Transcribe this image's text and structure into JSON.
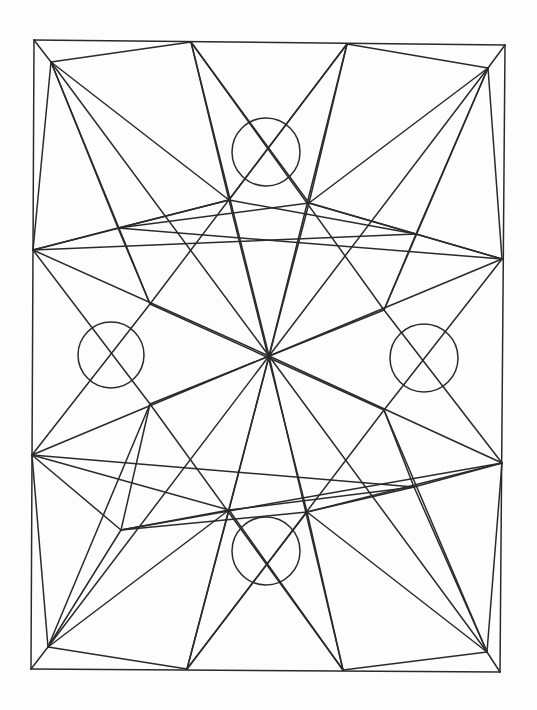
{
  "drawing": {
    "subject": "hand-drawn geometric star mandala line drawing",
    "stroke_color": "#2a2a2a",
    "background": "#fdfdfd",
    "points": {
      "TL": [
        34,
        40
      ],
      "TR": [
        505,
        45
      ],
      "BR": [
        500,
        672
      ],
      "BL": [
        31,
        669
      ],
      "A": [
        51,
        62
      ],
      "B": [
        488,
        68
      ],
      "C": [
        487,
        652
      ],
      "D": [
        48,
        647
      ],
      "T1": [
        191,
        42
      ],
      "T2": [
        347,
        44
      ],
      "B1": [
        187,
        669
      ],
      "B2": [
        343,
        670
      ],
      "L1": [
        33,
        250
      ],
      "L2": [
        32,
        455
      ],
      "R1": [
        502,
        259
      ],
      "R2": [
        502,
        463
      ],
      "O": [
        269,
        356
      ],
      "P1": [
        229,
        200
      ],
      "P2": [
        309,
        203
      ],
      "P3": [
        229,
        510
      ],
      "P4": [
        307,
        512
      ],
      "S1": [
        118,
        228
      ],
      "S2": [
        416,
        234
      ],
      "S3": [
        121,
        530
      ],
      "S4": [
        414,
        487
      ],
      "M1": [
        150,
        304
      ],
      "M2": [
        384,
        310
      ],
      "M3": [
        150,
        404
      ],
      "M4": [
        384,
        410
      ]
    },
    "segments": [
      [
        "TL",
        "TR"
      ],
      [
        "TR",
        "BR"
      ],
      [
        "BR",
        "BL"
      ],
      [
        "BL",
        "TL"
      ],
      [
        "TL",
        "A"
      ],
      [
        "TR",
        "B"
      ],
      [
        "BR",
        "C"
      ],
      [
        "BL",
        "D"
      ],
      [
        "A",
        "T1"
      ],
      [
        "T2",
        "B"
      ],
      [
        "B",
        "R1"
      ],
      [
        "R2",
        "C"
      ],
      [
        "C",
        "B2"
      ],
      [
        "B1",
        "D"
      ],
      [
        "D",
        "L2"
      ],
      [
        "L1",
        "A"
      ],
      [
        "A",
        "P1"
      ],
      [
        "A",
        "S1"
      ],
      [
        "A",
        "M1"
      ],
      [
        "A",
        "O"
      ],
      [
        "B",
        "P2"
      ],
      [
        "B",
        "S2"
      ],
      [
        "B",
        "M2"
      ],
      [
        "B",
        "O"
      ],
      [
        "C",
        "P4"
      ],
      [
        "C",
        "S4"
      ],
      [
        "C",
        "M4"
      ],
      [
        "C",
        "O"
      ],
      [
        "D",
        "P3"
      ],
      [
        "D",
        "S3"
      ],
      [
        "D",
        "M3"
      ],
      [
        "D",
        "O"
      ],
      [
        "T1",
        "P1"
      ],
      [
        "T1",
        "O"
      ],
      [
        "T1",
        "P2"
      ],
      [
        "T1",
        "M2"
      ],
      [
        "T2",
        "P2"
      ],
      [
        "T2",
        "O"
      ],
      [
        "T2",
        "P1"
      ],
      [
        "T2",
        "M1"
      ],
      [
        "B1",
        "P3"
      ],
      [
        "B1",
        "O"
      ],
      [
        "B1",
        "P4"
      ],
      [
        "B1",
        "M4"
      ],
      [
        "B2",
        "P4"
      ],
      [
        "B2",
        "O"
      ],
      [
        "B2",
        "P3"
      ],
      [
        "B2",
        "M3"
      ],
      [
        "L1",
        "S1"
      ],
      [
        "L1",
        "O"
      ],
      [
        "L1",
        "M3"
      ],
      [
        "L1",
        "P1"
      ],
      [
        "L2",
        "S3"
      ],
      [
        "L2",
        "O"
      ],
      [
        "L2",
        "M1"
      ],
      [
        "L2",
        "P3"
      ],
      [
        "R1",
        "S2"
      ],
      [
        "R1",
        "O"
      ],
      [
        "R1",
        "M4"
      ],
      [
        "R1",
        "P2"
      ],
      [
        "R2",
        "S4"
      ],
      [
        "R2",
        "O"
      ],
      [
        "R2",
        "M2"
      ],
      [
        "R2",
        "P4"
      ],
      [
        "S1",
        "P1"
      ],
      [
        "S1",
        "P2"
      ],
      [
        "S1",
        "M1"
      ],
      [
        "S1",
        "R1"
      ],
      [
        "S2",
        "P2"
      ],
      [
        "S2",
        "P1"
      ],
      [
        "S2",
        "M2"
      ],
      [
        "S2",
        "L1"
      ],
      [
        "S3",
        "P3"
      ],
      [
        "S3",
        "P4"
      ],
      [
        "S3",
        "M3"
      ],
      [
        "S3",
        "R2"
      ],
      [
        "S4",
        "P4"
      ],
      [
        "S4",
        "P3"
      ],
      [
        "S4",
        "M4"
      ],
      [
        "S4",
        "L2"
      ],
      [
        "P1",
        "P4"
      ],
      [
        "P2",
        "P3"
      ],
      [
        "M1",
        "M4"
      ],
      [
        "M2",
        "M3"
      ]
    ],
    "circles": [
      {
        "name": "top",
        "cx": 266,
        "cy": 152,
        "r": 34
      },
      {
        "name": "bottom",
        "cx": 266,
        "cy": 551,
        "r": 34
      },
      {
        "name": "left",
        "cx": 111,
        "cy": 355,
        "r": 33
      },
      {
        "name": "right",
        "cx": 424,
        "cy": 358,
        "r": 34
      }
    ]
  }
}
